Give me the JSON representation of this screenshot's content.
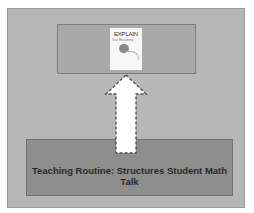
{
  "diagram": {
    "top_box": {
      "book": {
        "title": "EXPLAIN",
        "subtitle": "Your Reasoning",
        "icon": "book-cover-icon"
      }
    },
    "arrow": {
      "direction": "up",
      "icon": "up-arrow-icon",
      "style": "white fill, dashed dark outline"
    },
    "bottom_box": {
      "label": "Teaching Routine: Structures Student Math Talk"
    },
    "colors": {
      "background": "#ffffff",
      "panel": "#b7b7b7",
      "top_box": "#a9a9a9",
      "bottom_box": "#8e8e8e",
      "arrow_fill": "#ffffff",
      "text": "#2a2a2a"
    }
  }
}
